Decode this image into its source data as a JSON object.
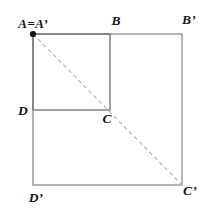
{
  "figure": {
    "labels": {
      "a_equals_a_prime": "A=A’",
      "b": "B",
      "b_prime": "B’",
      "d": "D",
      "c": "C",
      "d_prime": "D’",
      "c_prime": "C’"
    },
    "colors": {
      "background": "#ffffff",
      "outer_square_stroke": "#8c8c8c",
      "inner_square_stroke": "#6f6f6f",
      "dashed_diagonal": "#b4b4b4",
      "point": "#141414",
      "label_text": "#141414"
    }
  }
}
